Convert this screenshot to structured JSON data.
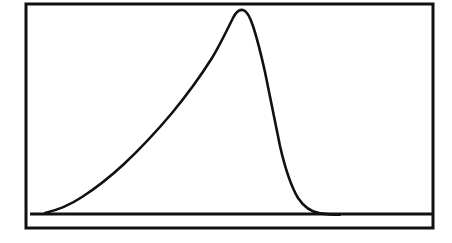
{
  "figure": {
    "background_color": "#ffffff",
    "ink_color": "#111111",
    "caption": "",
    "title": "",
    "alt_text": "Right-skewed unimodal distribution curve drawn inside a plain rectangular frame"
  },
  "frame": {
    "name": "plot-border",
    "x": 26,
    "y": 4,
    "width": 407,
    "height": 224,
    "stroke_width": 3,
    "stroke_color": "#111111",
    "fill": "none"
  },
  "baseline": {
    "name": "x-axis-baseline",
    "x1": 30,
    "y1": 214,
    "x2": 432,
    "y2": 214,
    "stroke_width": 3.2,
    "stroke_color": "#111111"
  },
  "curve": {
    "name": "distribution-curve",
    "stroke_width": 2.6,
    "stroke_color": "#111111",
    "fill": "none",
    "path": "M 45 213 C 58 210 70 205 82 197 C 96 188 110 177 124 164 C 140 149 156 132 172 113 C 186 96 200 77 212 58 C 220 45 227 30 233 18 C 236 12 239 9 243 10 C 247 11 250 17 253 26 C 257 38 261 54 265 72 C 270 96 275 122 280 146 C 285 168 291 186 298 198 C 304 207 311 212 320 213.4 C 327 214.4 333 214.6 340 214.6",
    "points": [
      {
        "x": 45,
        "y": 213
      },
      {
        "x": 82,
        "y": 197
      },
      {
        "x": 124,
        "y": 164
      },
      {
        "x": 172,
        "y": 113
      },
      {
        "x": 212,
        "y": 58
      },
      {
        "x": 234,
        "y": 10
      },
      {
        "x": 253,
        "y": 26
      },
      {
        "x": 265,
        "y": 72
      },
      {
        "x": 280,
        "y": 146
      },
      {
        "x": 298,
        "y": 198
      },
      {
        "x": 320,
        "y": 213
      },
      {
        "x": 340,
        "y": 214
      }
    ]
  },
  "chart_data": {
    "type": "line",
    "title": "",
    "subtitle": "",
    "xlabel": "",
    "ylabel": "",
    "xlim": [
      0,
      100
    ],
    "ylim": [
      0,
      1
    ],
    "grid": false,
    "legend": null,
    "axis_tick_labels": {
      "x": [],
      "y": []
    },
    "annotations": [],
    "series": [
      {
        "name": "density",
        "x": [
          0.0,
          4.6,
          9.2,
          13.8,
          18.4,
          23.0,
          27.6,
          32.2,
          36.8,
          41.4,
          46.0,
          50.6,
          51.5,
          55.2,
          57.5,
          59.8,
          62.1,
          64.4,
          66.7,
          69.0,
          71.3,
          73.6,
          78.2,
          82.8,
          87.4,
          92.0,
          96.6,
          100.0
        ],
        "y": [
          0.004,
          0.02,
          0.048,
          0.09,
          0.145,
          0.213,
          0.292,
          0.381,
          0.478,
          0.58,
          0.69,
          0.79,
          1.0,
          0.98,
          0.92,
          0.8,
          0.66,
          0.5,
          0.35,
          0.22,
          0.12,
          0.055,
          0.012,
          0.003,
          0.001,
          0.0,
          0.0,
          0.0
        ],
        "peak_x": 51.5,
        "peak_y": 1.0,
        "color": "#111111",
        "style": "solid",
        "width": 2.6
      }
    ]
  }
}
